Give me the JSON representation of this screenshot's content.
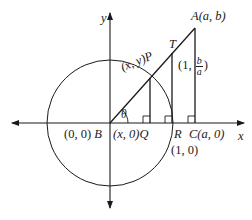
{
  "diagram": {
    "axes": {
      "x_label": "x",
      "y_label": "y"
    },
    "angle_label": "θ",
    "points": {
      "A": {
        "name": "A",
        "coords": "(a, b)"
      },
      "B": {
        "name": "B",
        "coords": "(0, 0)"
      },
      "C": {
        "name": "C",
        "coords": "(a, 0)"
      },
      "P": {
        "name": "P",
        "coords": "(x, y)"
      },
      "Q": {
        "name": "Q",
        "coords": "(x, 0)"
      },
      "R": {
        "name": "R",
        "coords": "(1, 0)"
      },
      "T": {
        "name": "T",
        "coords_prefix": "(1, ",
        "frac_num": "b",
        "frac_den": "a",
        "coords_suffix": ")"
      }
    },
    "colors": {
      "stroke": "#1a1a1a",
      "background": "#ffffff"
    }
  }
}
